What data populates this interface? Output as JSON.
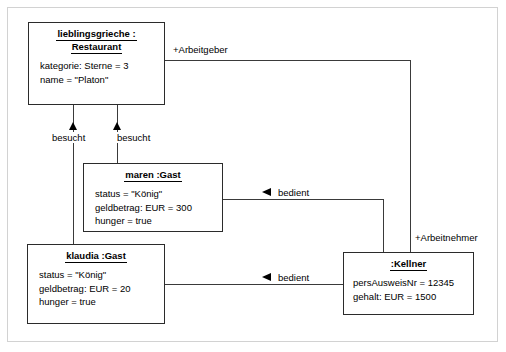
{
  "diagram": {
    "type": "uml-object-diagram",
    "frame": {
      "border_color": "#d2d2d2"
    },
    "objects": [
      {
        "id": "restaurant",
        "title_line1": "lieblingsgrieche :",
        "title_line2": "Restaurant",
        "attributes": [
          "kategorie: Sterne = 3",
          "name = \"Platon\""
        ]
      },
      {
        "id": "maren",
        "title_line1": "maren :Gast",
        "title_line2": "",
        "attributes": [
          "status = \"König\"",
          "geldbetrag: EUR = 300",
          "hunger = true"
        ]
      },
      {
        "id": "klaudia",
        "title_line1": "klaudia :Gast",
        "title_line2": "",
        "attributes": [
          "status = \"König\"",
          "geldbetrag: EUR = 20",
          "hunger = true"
        ]
      },
      {
        "id": "kellner",
        "title_line1": ":Kellner",
        "title_line2": "",
        "attributes": [
          "persAusweisNr = 12345",
          "gehalt: EUR = 1500"
        ]
      }
    ],
    "links": [
      {
        "id": "besucht-klaudia",
        "label": "besucht",
        "marker": "triangle-up"
      },
      {
        "id": "besucht-maren",
        "label": "besucht",
        "marker": "triangle-up"
      },
      {
        "id": "bedient-maren",
        "label": "bedient",
        "marker": "triangle-left"
      },
      {
        "id": "bedient-klaudia",
        "label": "bedient",
        "marker": "triangle-left"
      },
      {
        "id": "arbeitgeber",
        "label": "+Arbeitgeber",
        "marker": "none"
      },
      {
        "id": "arbeitnehmer",
        "label": "+Arbeitnehmer",
        "marker": "none"
      }
    ]
  }
}
